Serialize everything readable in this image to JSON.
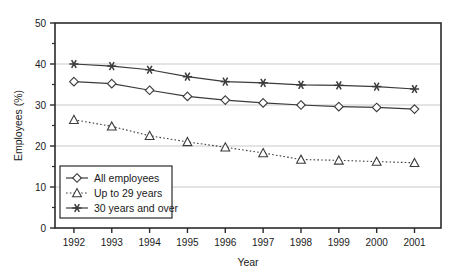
{
  "chart_data": {
    "type": "line",
    "title": "",
    "xlabel": "Year",
    "ylabel": "Employees (%)",
    "categories": [
      "1992",
      "1993",
      "1994",
      "1995",
      "1996",
      "1997",
      "1998",
      "1999",
      "2000",
      "2001"
    ],
    "x": [
      1992,
      1993,
      1994,
      1995,
      1996,
      1997,
      1998,
      1999,
      2000,
      2001
    ],
    "xlim": [
      1991.5,
      2001.7
    ],
    "ylim": [
      0,
      50
    ],
    "yticks": [
      0,
      10,
      20,
      30,
      40,
      50
    ],
    "yticks_minor": [
      5,
      15,
      25,
      35,
      45
    ],
    "ytick_labels": [
      "0",
      "10",
      "20",
      "30",
      "40",
      "50"
    ],
    "grid": "horizontal-major",
    "legend_position": "bottom-left-inside",
    "series": [
      {
        "name": "All employees",
        "marker": "diamond",
        "line_style": "solid",
        "color": "#3b3b3b",
        "values": [
          35.7,
          35.2,
          33.6,
          32.1,
          31.2,
          30.5,
          30.0,
          29.6,
          29.4,
          29.0
        ]
      },
      {
        "name": "Up to 29 years",
        "marker": "triangle",
        "line_style": "dotted",
        "color": "#3b3b3b",
        "values": [
          26.4,
          24.8,
          22.5,
          21.0,
          19.7,
          18.3,
          16.7,
          16.5,
          16.2,
          15.9
        ]
      },
      {
        "name": "30 years and over",
        "marker": "star",
        "line_style": "solid",
        "color": "#3b3b3b",
        "values": [
          40.0,
          39.5,
          38.6,
          36.9,
          35.7,
          35.4,
          34.9,
          34.8,
          34.5,
          33.9
        ]
      }
    ]
  },
  "legend": {
    "items": [
      {
        "label": "All employees",
        "marker": "diamond",
        "line_style": "solid"
      },
      {
        "label": "Up to 29 years",
        "marker": "triangle",
        "line_style": "dotted"
      },
      {
        "label": "30 years and over",
        "marker": "star",
        "line_style": "solid"
      }
    ]
  },
  "axes": {
    "x_title": "Year",
    "y_title": "Employees (%)"
  },
  "colors": {
    "axis": "#2b2b2b",
    "grid": "#c9c9c9",
    "series": "#3b3b3b",
    "background": "#ffffff"
  }
}
